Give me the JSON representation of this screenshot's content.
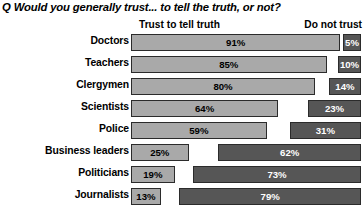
{
  "title": "Q Would you generally trust... to tell the truth, or not?",
  "legend": {
    "left_label": "Trust to tell truth",
    "right_label": "Do not trust"
  },
  "colors": {
    "trust_bar": "#a9a9a9",
    "distrust_bar": "#565656",
    "bar_outline": "#2b2b2b",
    "background": "#ffffff",
    "trust_value_text": "#000000",
    "distrust_value_text": "#ffffff"
  },
  "chart_data": {
    "type": "bar",
    "orientation": "horizontal",
    "title": "Q Would you generally trust... to tell the truth, or not?",
    "xlabel": "",
    "ylabel": "",
    "xlim": [
      0,
      100
    ],
    "grid": false,
    "legend_position": "top",
    "categories": [
      "Doctors",
      "Teachers",
      "Clergymen",
      "Scientists",
      "Police",
      "Business leaders",
      "Politicians",
      "Journalists"
    ],
    "series": [
      {
        "name": "Trust to tell truth",
        "align": "left",
        "values": [
          91,
          85,
          80,
          64,
          59,
          25,
          19,
          13
        ],
        "labels": [
          "91%",
          "85%",
          "80%",
          "64%",
          "59%",
          "25%",
          "19%",
          "13%"
        ]
      },
      {
        "name": "Do not trust",
        "align": "right",
        "values": [
          5,
          10,
          14,
          23,
          31,
          62,
          73,
          79
        ],
        "labels": [
          "5%",
          "10%",
          "14%",
          "23%",
          "31%",
          "62%",
          "73%",
          "79%"
        ]
      }
    ]
  },
  "rows": [
    {
      "category": "Doctors",
      "trust": "91%",
      "distrust": "5%"
    },
    {
      "category": "Teachers",
      "trust": "85%",
      "distrust": "10%"
    },
    {
      "category": "Clergymen",
      "trust": "80%",
      "distrust": "14%"
    },
    {
      "category": "Scientists",
      "trust": "64%",
      "distrust": "23%"
    },
    {
      "category": "Police",
      "trust": "59%",
      "distrust": "31%"
    },
    {
      "category": "Business leaders",
      "trust": "25%",
      "distrust": "62%"
    },
    {
      "category": "Politicians",
      "trust": "19%",
      "distrust": "73%"
    },
    {
      "category": "Journalists",
      "trust": "13%",
      "distrust": "79%"
    }
  ]
}
